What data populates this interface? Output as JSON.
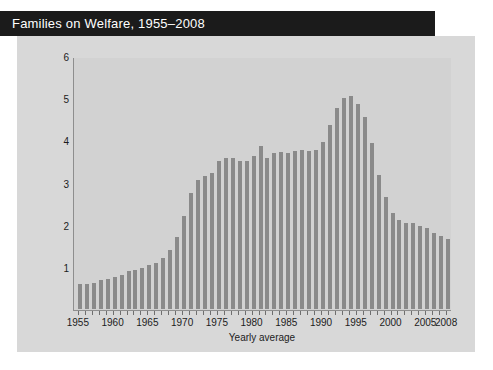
{
  "title": "Families on Welfare, 1955–2008",
  "colors": {
    "banner_bg": "#1b1b1b",
    "banner_text": "#ffffff",
    "card_bg": "#d8d8d8",
    "panel_bg": "#d2d2d2",
    "bar": "#8a8a8a",
    "axis": "#8e8e8e",
    "text": "#1c1c1c"
  },
  "chart_data": {
    "type": "bar",
    "title": "Families on Welfare, 1955–2008",
    "xlabel": "Yearly average",
    "ylabel": "Number of families (in millions)",
    "xlim": [
      1954.3,
      2008.7
    ],
    "ylim": [
      0,
      6
    ],
    "yticks": [
      1,
      2,
      3,
      4,
      5,
      6
    ],
    "ytick_labels": [
      "1",
      "2",
      "3",
      "4",
      "5",
      "6"
    ],
    "xtick_labels": [
      "1955",
      "1960",
      "1965",
      "1970",
      "1975",
      "1980",
      "1985",
      "1990",
      "1995",
      "2000",
      "2005",
      "2008"
    ],
    "xtick_values": [
      1955,
      1960,
      1965,
      1970,
      1975,
      1980,
      1985,
      1990,
      1995,
      2000,
      2005,
      2008
    ],
    "grid": false,
    "legend": false,
    "units": "millions of families",
    "categories": [
      1955,
      1956,
      1957,
      1958,
      1959,
      1960,
      1961,
      1962,
      1963,
      1964,
      1965,
      1966,
      1967,
      1968,
      1969,
      1970,
      1971,
      1972,
      1973,
      1974,
      1975,
      1976,
      1977,
      1978,
      1979,
      1980,
      1981,
      1982,
      1983,
      1984,
      1985,
      1986,
      1987,
      1988,
      1989,
      1990,
      1991,
      1992,
      1993,
      1994,
      1995,
      1996,
      1997,
      1998,
      1999,
      2000,
      2001,
      2002,
      2003,
      2004,
      2005,
      2006,
      2007,
      2008
    ],
    "values": [
      0.6,
      0.6,
      0.62,
      0.68,
      0.7,
      0.75,
      0.8,
      0.9,
      0.93,
      0.98,
      1.05,
      1.09,
      1.22,
      1.41,
      1.7,
      2.21,
      2.76,
      3.05,
      3.15,
      3.22,
      3.5,
      3.58,
      3.58,
      3.52,
      3.5,
      3.64,
      3.87,
      3.57,
      3.69,
      3.72,
      3.7,
      3.75,
      3.78,
      3.75,
      3.77,
      3.97,
      4.37,
      4.77,
      5.0,
      5.05,
      4.87,
      4.55,
      3.94,
      3.18,
      2.65,
      2.27,
      2.12,
      2.03,
      2.03,
      1.97,
      1.91,
      1.81,
      1.72,
      1.66
    ]
  }
}
